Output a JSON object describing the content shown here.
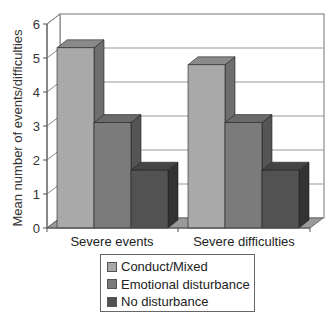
{
  "chart_data": {
    "type": "bar",
    "style": "3d-clustered",
    "title": "",
    "xlabel": "",
    "ylabel": "Mean number of events/difficulties",
    "ylim": [
      0,
      6
    ],
    "yticks": [
      0,
      1,
      2,
      3,
      4,
      5,
      6
    ],
    "grid": true,
    "legend_position": "bottom",
    "categories": [
      "Severe events",
      "Severe difficulties"
    ],
    "series": [
      {
        "name": "Conduct/Mixed",
        "values": [
          5.3,
          4.8
        ],
        "color": "#a9a9a9",
        "side": "#6e6e6e",
        "top": "#8a8a8a"
      },
      {
        "name": "Emotional disturbance",
        "values": [
          3.1,
          3.1
        ],
        "color": "#7b7b7b",
        "side": "#555555",
        "top": "#6a6a6a"
      },
      {
        "name": "No disturbance",
        "values": [
          1.7,
          1.7
        ],
        "color": "#525252",
        "side": "#333333",
        "top": "#444444"
      }
    ]
  }
}
